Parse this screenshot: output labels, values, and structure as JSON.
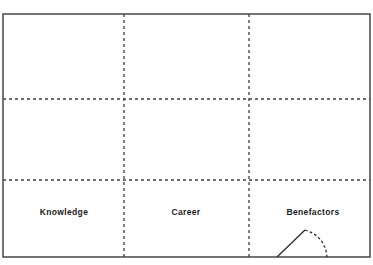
{
  "diagram": {
    "title": "",
    "canvas": {
      "width": 373,
      "height": 265,
      "background": "#ffffff"
    },
    "frame": {
      "name": "outer-rectangle",
      "x": 3,
      "y": 14,
      "width": 367,
      "height": 243,
      "stroke": "#3a3a3a",
      "stroke_width": 1.4,
      "style": "solid",
      "fill": "none"
    },
    "grid": {
      "stroke": "#3f3f3f",
      "stroke_width": 1.3,
      "dash_pattern": "3 3",
      "horizontal_lines": [
        {
          "name": "horizontal-gridline-1",
          "y": 99
        },
        {
          "name": "horizontal-gridline-2",
          "y": 180
        }
      ],
      "vertical_lines": [
        {
          "name": "vertical-gridline-1",
          "x": 124
        },
        {
          "name": "vertical-gridline-2",
          "x": 249
        }
      ]
    },
    "labels": [
      {
        "name": "label-knowledge",
        "text": "Knowledge",
        "x": 64,
        "y": 212
      },
      {
        "name": "label-career",
        "text": "Career",
        "x": 186,
        "y": 212
      },
      {
        "name": "label-benefactors",
        "text": "Benefactors",
        "x": 313,
        "y": 212
      }
    ],
    "overlay_curve": {
      "name": "benefactors-peak-curve",
      "stroke": "#2b2b2b",
      "stroke_width": 1.3,
      "solid_segment": {
        "name": "curve-rising-solid-segment",
        "from": {
          "x": 277,
          "y": 257
        },
        "to": {
          "x": 305,
          "y": 230
        }
      },
      "dashed_segment": {
        "name": "curve-falling-dashed-arc",
        "from": {
          "x": 305,
          "y": 230
        },
        "control": {
          "x": 325,
          "y": 236
        },
        "to": {
          "x": 327,
          "y": 257
        },
        "dash_pattern": "2.6 2.4"
      }
    }
  },
  "chart_data": {
    "type": "table",
    "title": "",
    "xlabel": "",
    "ylabel": "",
    "columns": [
      "Knowledge",
      "Career",
      "Benefactors"
    ],
    "rows": 3,
    "grid": true,
    "legend": "none",
    "annotations": [
      "Peak curve over Benefactors column"
    ]
  }
}
